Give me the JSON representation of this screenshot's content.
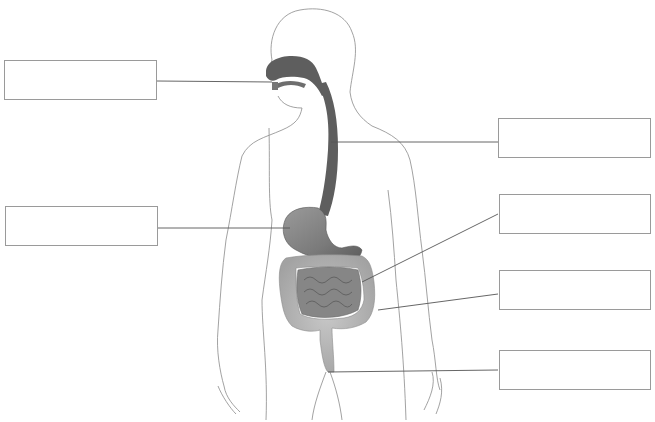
{
  "diagram": {
    "title": "",
    "colors": {
      "outline": "#8a8a8a",
      "organ_dark": "#5e5e5e",
      "organ_mid": "#8c8c8c",
      "organ_light": "#b8b8b8",
      "leader_line": "#555555",
      "box_border": "#9a9a9a"
    },
    "label_boxes": [
      {
        "id": "mouth",
        "text": "",
        "side": "left"
      },
      {
        "id": "stomach",
        "text": "",
        "side": "left"
      },
      {
        "id": "esophagus",
        "text": "",
        "side": "right"
      },
      {
        "id": "small-intestine",
        "text": "",
        "side": "right"
      },
      {
        "id": "large-intestine",
        "text": "",
        "side": "right"
      },
      {
        "id": "rectum",
        "text": "",
        "side": "right"
      }
    ]
  }
}
